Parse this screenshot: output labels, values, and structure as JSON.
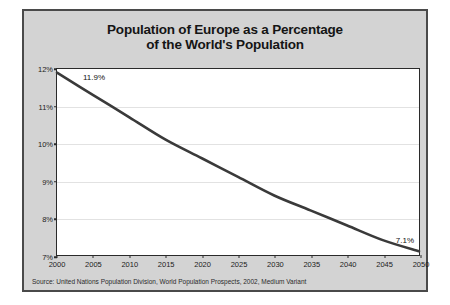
{
  "chart_data": {
    "type": "line",
    "title": "Population of Europe as a Percentage of the World's Population",
    "title_lines": [
      "Population of Europe as a Percentage",
      "of the World's Population"
    ],
    "xlabel": "",
    "ylabel": "",
    "x": [
      2000,
      2005,
      2010,
      2015,
      2020,
      2025,
      2030,
      2035,
      2040,
      2045,
      2050
    ],
    "values": [
      11.9,
      11.3,
      10.7,
      10.1,
      9.6,
      9.1,
      8.6,
      8.2,
      7.8,
      7.4,
      7.1
    ],
    "series": [
      {
        "name": "Europe share of world population",
        "values": [
          11.9,
          11.3,
          10.7,
          10.1,
          9.6,
          9.1,
          8.6,
          8.2,
          7.8,
          7.4,
          7.1
        ]
      }
    ],
    "xlim": [
      2000,
      2050
    ],
    "ylim": [
      7,
      12
    ],
    "xticks": [
      "2000",
      "2005",
      "2010",
      "2015",
      "2020",
      "2025",
      "2030",
      "2035",
      "2040",
      "2045",
      "2050"
    ],
    "yticks": [
      "7%",
      "8%",
      "9%",
      "10%",
      "11%",
      "12%"
    ],
    "ytick_values": [
      7,
      8,
      9,
      10,
      11,
      12
    ],
    "grid": true,
    "legend": "none",
    "annotations": [
      {
        "name": "start-value",
        "text": "11.9%",
        "x": 2000,
        "y": 11.9
      },
      {
        "name": "end-value",
        "text": "7.1%",
        "x": 2050,
        "y": 7.1
      }
    ],
    "line_color": "#3a3a3a",
    "plot_background": "#ffffff",
    "figure_background": "#d3d3d3"
  },
  "source": {
    "text": "Source: United Nations Population Division, World Population Prospects, 2002, Medium Variant"
  }
}
